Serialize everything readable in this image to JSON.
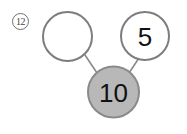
{
  "worksheet": {
    "problem_number": "12",
    "background_color": "#ffffff"
  },
  "number_bond": {
    "title": "number-bond",
    "whole": {
      "label": "10",
      "filled": true,
      "fill_color": "#b8b8b8",
      "stroke_color": "#8a8a8a"
    },
    "parts": [
      {
        "label": "",
        "filled": false,
        "fill_color": "#ffffff",
        "stroke_color": "#7d7d7d",
        "position": "left"
      },
      {
        "label": "5",
        "filled": false,
        "fill_color": "#ffffff",
        "stroke_color": "#7d7d7d",
        "position": "right"
      }
    ],
    "connector_color": "#8a8a8a"
  }
}
